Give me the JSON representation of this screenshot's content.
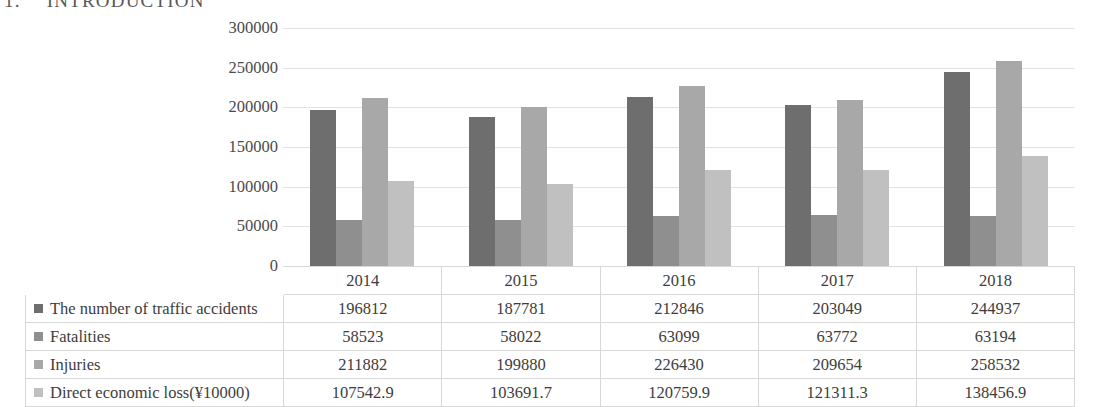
{
  "page_header": {
    "number": "1.",
    "title": "INTRODUCTION"
  },
  "chart_data": {
    "type": "bar",
    "title": "",
    "xlabel": "",
    "ylabel": "",
    "categories": [
      "2014",
      "2015",
      "2016",
      "2017",
      "2018"
    ],
    "series": [
      {
        "name": "The number of traffic accidents",
        "color": "#6e6e6e",
        "values": [
          196812,
          187781,
          212846,
          203049,
          244937
        ],
        "display": [
          "196812",
          "187781",
          "212846",
          "203049",
          "244937"
        ]
      },
      {
        "name": "Fatalities",
        "color": "#8f8f8f",
        "values": [
          58523,
          58022,
          63099,
          63772,
          63194
        ],
        "display": [
          "58523",
          "58022",
          "63099",
          "63772",
          "63194"
        ]
      },
      {
        "name": "Injuries",
        "color": "#a8a8a8",
        "values": [
          211882,
          199880,
          226430,
          209654,
          258532
        ],
        "display": [
          "211882",
          "199880",
          "226430",
          "209654",
          "258532"
        ]
      },
      {
        "name": "Direct economic loss(¥10000)",
        "color": "#c0c0c0",
        "values": [
          107542.9,
          103691.7,
          120759.9,
          121311.3,
          138456.9
        ],
        "display": [
          "107542.9",
          "103691.7",
          "120759.9",
          "121311.3",
          "138456.9"
        ]
      }
    ],
    "yticks": [
      0,
      50000,
      100000,
      150000,
      200000,
      250000,
      300000
    ],
    "ytick_labels": [
      "0",
      "50000",
      "100000",
      "150000",
      "200000",
      "250000",
      "300000"
    ],
    "ylim": [
      0,
      300000
    ],
    "grid": true,
    "legend_position": "table-row-headers",
    "gridline_color": "#e2e2e2"
  }
}
